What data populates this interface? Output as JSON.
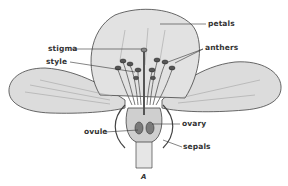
{
  "diagram": {
    "caption": "A",
    "labels": {
      "petals": "petals",
      "stigma": "stigma",
      "anthers": "anthers",
      "style": "style",
      "ovule": "ovule",
      "ovary": "ovary",
      "sepals": "sepals"
    },
    "colors": {
      "petal_fill": "#dedede",
      "line": "#444444",
      "shading": "#8a8a8a",
      "background": "#ffffff"
    }
  }
}
